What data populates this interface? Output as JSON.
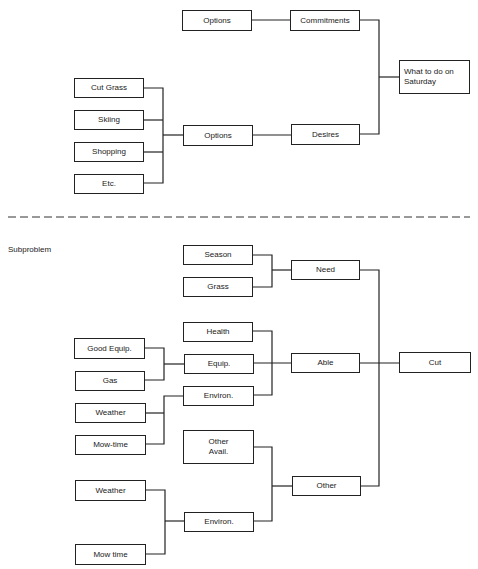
{
  "top": {
    "options_top": "Options",
    "commitments": "Commitments",
    "goal": "What to do on\nSaturday",
    "goal_line1": "What to do on",
    "goal_line2": "Saturday",
    "list": [
      "Cut Grass",
      "Skiing",
      "Shopping",
      "Etc."
    ],
    "options_mid": "Options",
    "desires": "Desires"
  },
  "divider": {
    "style": "dashed"
  },
  "bottom": {
    "section_label": "Subproblem",
    "season": "Season",
    "grass": "Grass",
    "need": "Need",
    "health": "Health",
    "good_equip": "Good Equip.",
    "equip": "Equip.",
    "able": "Able",
    "cut": "Cut",
    "gas": "Gas",
    "environ_1": "Environ.",
    "weather_1": "Weather",
    "mow_time_1": "Mow-time",
    "other_avail_line1": "Other",
    "other_avail_line2": "Avail.",
    "other": "Other",
    "weather_2": "Weather",
    "environ_2": "Environ.",
    "mow_time_2": "Mow time"
  }
}
